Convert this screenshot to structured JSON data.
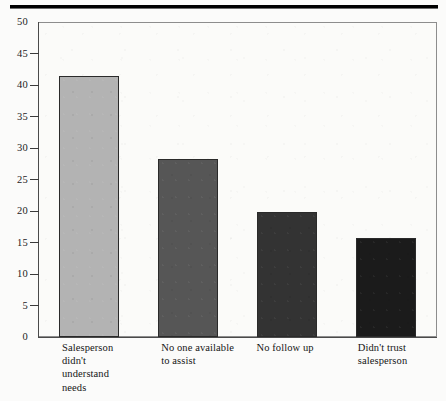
{
  "figure": {
    "background_color": "#fbfbfa",
    "plot_background_color": "#fbfbf9",
    "top_rule_color": "#000000",
    "axis_color": "#4a4a4a"
  },
  "chart_data": {
    "type": "bar",
    "title": "",
    "subtitle": "",
    "xlabel": "",
    "ylabel": "",
    "categories": [
      "Salesperson\ndidn't\nunderstand\nneeds",
      "No one available\nto assist",
      "No follow up",
      "Didn't trust\nsalesperson"
    ],
    "values": [
      41.4,
      28.2,
      19.8,
      15.7
    ],
    "bar_colors": [
      "#b3b3b3",
      "#565656",
      "#333333",
      "#1b1b1b"
    ],
    "bar_edge_color": "#2a2a2a",
    "ylim": [
      0,
      50
    ],
    "yticks": [
      0,
      5,
      10,
      15,
      20,
      25,
      30,
      35,
      40,
      45,
      50
    ],
    "ytick_labels": [
      "0",
      "5",
      "10",
      "15",
      "20",
      "25",
      "30",
      "35",
      "40",
      "45",
      "50"
    ],
    "grid": false,
    "legend": null,
    "legend_position": "none",
    "annotations": []
  }
}
